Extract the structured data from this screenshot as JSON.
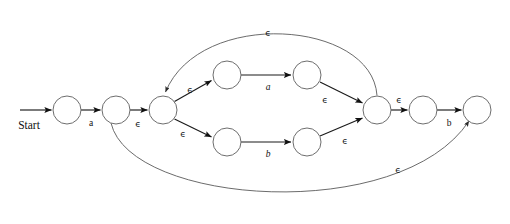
{
  "diagram": {
    "type": "finite-automaton",
    "width": 510,
    "height": 224,
    "background_color": "#ffffff",
    "edge_color": "#1a1a1a",
    "arc_color": "#5a5a5a",
    "state_stroke_color": "#6e6e6e",
    "state_fill_color": "#ffffff",
    "state_radius": 14,
    "start_label": "Start",
    "epsilon_symbol": "ϵ",
    "alphabet": [
      "a",
      "b"
    ],
    "states": [
      {
        "id": "q0",
        "name": "state-0",
        "cx": 67,
        "cy": 110,
        "role": "start"
      },
      {
        "id": "q1",
        "name": "state-1",
        "cx": 116,
        "cy": 110,
        "role": "normal"
      },
      {
        "id": "q2",
        "name": "state-2",
        "cx": 163,
        "cy": 110,
        "role": "split"
      },
      {
        "id": "q3",
        "name": "state-3",
        "cx": 227,
        "cy": 75,
        "role": "normal"
      },
      {
        "id": "q4",
        "name": "state-4",
        "cx": 307,
        "cy": 75,
        "role": "normal"
      },
      {
        "id": "q5",
        "name": "state-5",
        "cx": 227,
        "cy": 142,
        "role": "normal"
      },
      {
        "id": "q6",
        "name": "state-6",
        "cx": 307,
        "cy": 142,
        "role": "normal"
      },
      {
        "id": "q7",
        "name": "state-7",
        "cx": 377,
        "cy": 110,
        "role": "merge"
      },
      {
        "id": "q8",
        "name": "state-8",
        "cx": 423,
        "cy": 110,
        "role": "normal"
      },
      {
        "id": "q9",
        "name": "state-9",
        "cx": 477,
        "cy": 110,
        "role": "accept"
      }
    ],
    "transitions": [
      {
        "id": "t-start",
        "from": "",
        "to": "q0",
        "label": "",
        "shape": "start-arrow"
      },
      {
        "id": "t0",
        "from": "q0",
        "to": "q1",
        "label": "a",
        "italic": false,
        "shape": "line"
      },
      {
        "id": "t1",
        "from": "q1",
        "to": "q2",
        "label": "ϵ",
        "italic": false,
        "shape": "line"
      },
      {
        "id": "t2",
        "from": "q2",
        "to": "q3",
        "label": "ϵ",
        "italic": false,
        "shape": "line"
      },
      {
        "id": "t3",
        "from": "q3",
        "to": "q4",
        "label": "a",
        "italic": true,
        "shape": "line"
      },
      {
        "id": "t4",
        "from": "q2",
        "to": "q5",
        "label": "ϵ",
        "italic": false,
        "shape": "line"
      },
      {
        "id": "t5",
        "from": "q5",
        "to": "q6",
        "label": "b",
        "italic": true,
        "shape": "line"
      },
      {
        "id": "t6",
        "from": "q4",
        "to": "q7",
        "label": "ϵ",
        "italic": false,
        "shape": "line"
      },
      {
        "id": "t7",
        "from": "q6",
        "to": "q7",
        "label": "ϵ",
        "italic": false,
        "shape": "line"
      },
      {
        "id": "t8",
        "from": "q7",
        "to": "q8",
        "label": "ϵ",
        "italic": false,
        "shape": "line"
      },
      {
        "id": "t9",
        "from": "q8",
        "to": "q9",
        "label": "b",
        "italic": false,
        "shape": "line"
      },
      {
        "id": "t10",
        "from": "q7",
        "to": "q2",
        "label": "ϵ",
        "italic": false,
        "shape": "arc-top"
      },
      {
        "id": "t11",
        "from": "q1",
        "to": "q9",
        "label": "ϵ",
        "italic": false,
        "shape": "arc-bottom"
      }
    ],
    "labels": {
      "start": "Start",
      "a_first": "a",
      "eps_q1_q2": "ϵ",
      "eps_split_top": "ϵ",
      "eps_split_bottom": "ϵ",
      "a_upper": "a",
      "b_lower": "b",
      "eps_merge_top": "ϵ",
      "eps_merge_bottom": "ϵ",
      "eps_q7_q8": "ϵ",
      "b_final": "b",
      "eps_loop_top": "ϵ",
      "eps_bypass_bottom": "ϵ"
    }
  }
}
